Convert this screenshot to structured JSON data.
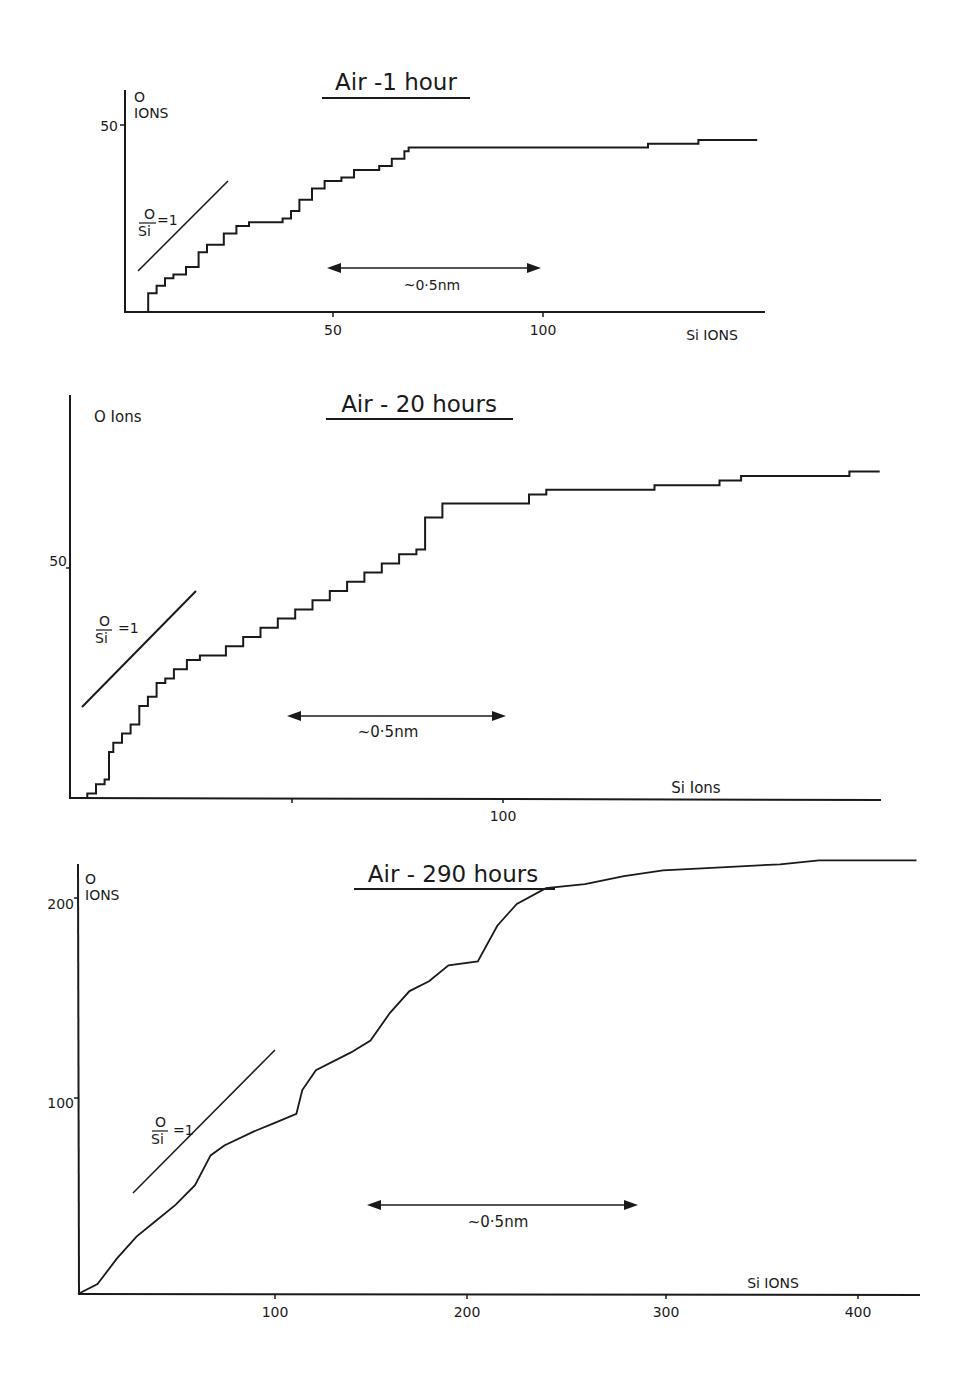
{
  "figure": {
    "panels": [
      {
        "title": "Air -1 hour",
        "ylabel_line1": "O",
        "ylabel_line2": "IONS",
        "xlabel": "Si IONS",
        "yticks": [
          "50"
        ],
        "xticks": [
          "50",
          "100"
        ],
        "ratio_num": "O",
        "ratio_den": "Si",
        "ratio_eq": "=1",
        "scale_label": "~0·5nm"
      },
      {
        "title": "Air - 20 hours",
        "ylabel_line1": "O Ions",
        "ylabel_line2": "",
        "xlabel": "Si  Ions",
        "yticks": [
          "50"
        ],
        "xticks": [
          "100"
        ],
        "ratio_num": "O",
        "ratio_den": "Si",
        "ratio_eq": "=1",
        "scale_label": "~0·5nm"
      },
      {
        "title": "Air - 290 hours",
        "ylabel_line1": "O",
        "ylabel_line2": "IONS",
        "xlabel": "Si IONS",
        "yticks": [
          "200",
          "100"
        ],
        "xticks": [
          "100",
          "200",
          "300",
          "400"
        ],
        "ratio_num": "O",
        "ratio_den": "Si",
        "ratio_eq": "=1",
        "scale_label": "~0·5nm"
      }
    ]
  },
  "chart_data": [
    {
      "type": "line",
      "title": "Air -1 hour",
      "xlabel": "Si IONS",
      "ylabel": "O IONS",
      "xlim": [
        0,
        152
      ],
      "ylim": [
        0,
        55
      ],
      "grid": false,
      "annotations": [
        "O/Si = 1 reference slope",
        "~0.5nm depth scale arrow spanning Si ions ~48 to ~99"
      ],
      "x": [
        5,
        6,
        8,
        10,
        12,
        15,
        18,
        20,
        24,
        27,
        30,
        34,
        38,
        40,
        42,
        45,
        48,
        52,
        55,
        58,
        61,
        64,
        67,
        68,
        80,
        100,
        120,
        125,
        130,
        137,
        145,
        151
      ],
      "y": [
        0,
        5,
        7,
        9,
        10,
        12,
        16,
        18,
        21,
        23,
        24,
        24,
        25,
        27,
        30,
        33,
        35,
        36,
        38,
        38,
        39,
        41,
        43,
        44,
        44,
        44,
        44,
        45,
        45,
        46,
        46,
        46
      ]
    },
    {
      "type": "line",
      "title": "Air - 20 hours",
      "xlabel": "Si Ions",
      "ylabel": "O Ions",
      "xlim": [
        0,
        187
      ],
      "ylim": [
        0,
        78
      ],
      "grid": false,
      "annotations": [
        "O/Si = 1 reference slope",
        "~0.5nm depth scale arrow spanning Si ions ~50 to ~100"
      ],
      "x": [
        2,
        4,
        6,
        8,
        9,
        10,
        12,
        14,
        16,
        18,
        20,
        22,
        24,
        27,
        30,
        36,
        40,
        44,
        48,
        52,
        56,
        60,
        64,
        68,
        72,
        76,
        80,
        82,
        86,
        90,
        104,
        106,
        110,
        130,
        135,
        150,
        155,
        160,
        180,
        187
      ],
      "y": [
        0,
        1,
        3,
        4,
        10,
        12,
        14,
        16,
        20,
        22,
        25,
        26,
        28,
        30,
        31,
        33,
        35,
        37,
        39,
        41,
        43,
        45,
        47,
        49,
        51,
        53,
        54,
        61,
        64,
        64,
        64,
        66,
        67,
        67,
        68,
        69,
        70,
        70,
        71,
        71
      ]
    },
    {
      "type": "line",
      "title": "Air - 290 hours",
      "xlabel": "Si IONS",
      "ylabel": "O IONS",
      "xlim": [
        0,
        430
      ],
      "ylim": [
        0,
        225
      ],
      "grid": false,
      "annotations": [
        "O/Si = 1 reference slope",
        "~0.5nm depth scale arrow spanning Si ions ~150 to ~290"
      ],
      "x": [
        0,
        10,
        20,
        30,
        40,
        50,
        60,
        68,
        75,
        90,
        100,
        112,
        115,
        122,
        140,
        150,
        160,
        170,
        180,
        190,
        205,
        215,
        225,
        240,
        260,
        280,
        300,
        320,
        360,
        380,
        430
      ],
      "y": [
        0,
        5,
        18,
        29,
        37,
        45,
        55,
        70,
        75,
        82,
        86,
        91,
        103,
        113,
        122,
        128,
        142,
        153,
        158,
        166,
        168,
        186,
        197,
        205,
        207,
        211,
        214,
        215,
        217,
        219,
        219
      ]
    }
  ]
}
